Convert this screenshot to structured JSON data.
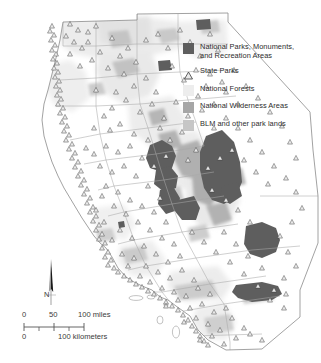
{
  "map": {
    "title": "California Parks and Protected Lands",
    "region": "California",
    "background_color": "#ffffff",
    "outline_color": "#8a8a8a",
    "county_line_color": "#a8a8a8"
  },
  "legend": {
    "items": [
      {
        "id": "national-parks",
        "label": "National Parks, Monuments,\nand Recreation Areas",
        "swatch_type": "square",
        "color": "#5e5e5e"
      },
      {
        "id": "state-parks",
        "label": "State Parks",
        "swatch_type": "triangle",
        "color": "#4a4a4a"
      },
      {
        "id": "national-forests",
        "label": "National Forests",
        "swatch_type": "square",
        "color": "#ededed"
      },
      {
        "id": "national-wilderness",
        "label": "National Wilderness Areas",
        "swatch_type": "square",
        "color": "#a6a6a6"
      },
      {
        "id": "blm-lands",
        "label": "BLM and other park lands",
        "swatch_type": "square",
        "color": "#c6c6c6"
      }
    ]
  },
  "north_arrow": {
    "label": "N"
  },
  "scale_bar": {
    "miles": {
      "start": "0",
      "mid": "50",
      "end": "100 miles"
    },
    "kilometers": {
      "start": "0",
      "end": "100 kilometers"
    }
  }
}
